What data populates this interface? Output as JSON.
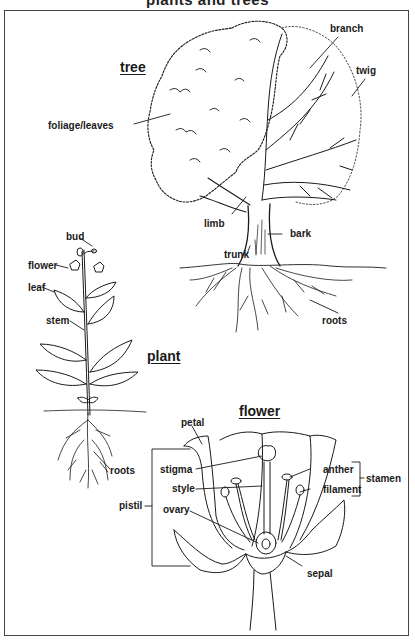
{
  "title": "plants and trees",
  "sections": {
    "tree": {
      "heading": "tree",
      "labels": {
        "branch": "branch",
        "twig": "twig",
        "foliage": "foliage/leaves",
        "limb": "limb",
        "bark": "bark",
        "trunk": "trunk",
        "roots": "roots"
      }
    },
    "plant": {
      "heading": "plant",
      "labels": {
        "bud": "bud",
        "flower": "flower",
        "leaf": "leaf",
        "stem": "stem",
        "roots": "roots"
      }
    },
    "flower": {
      "heading": "flower",
      "labels": {
        "petal": "petal",
        "stigma": "stigma",
        "style": "style",
        "ovary": "ovary",
        "pistil": "pistil",
        "anther": "anther",
        "filament": "filament",
        "stamen": "stamen",
        "sepal": "sepal"
      }
    }
  },
  "colors": {
    "line": "#1a1a1a",
    "frame": "#444444",
    "background": "#ffffff"
  }
}
